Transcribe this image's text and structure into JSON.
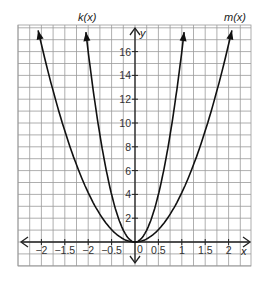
{
  "chart_data": {
    "type": "line",
    "title": "",
    "xlabel": "x",
    "ylabel": "y",
    "xlim": [
      -2.5,
      2.5
    ],
    "ylim": [
      -1,
      18
    ],
    "grid": true,
    "x_grid_step": 0.25,
    "y_grid_step": 1,
    "x_tick_labels": [
      "−2",
      "−1.5",
      "−2",
      "−0.5",
      "0",
      "0.5",
      "1",
      "1.5",
      "2"
    ],
    "x_tick_values": [
      -2,
      -1.5,
      -1,
      -0.5,
      0,
      0.5,
      1,
      1.5,
      2
    ],
    "y_tick_labels": [
      "2",
      "4",
      "6",
      "8",
      "10",
      "12",
      "14",
      "16"
    ],
    "y_tick_values": [
      2,
      4,
      6,
      8,
      10,
      12,
      14,
      16
    ],
    "series": [
      {
        "name": "k(x)",
        "description": "narrow upward parabola through origin",
        "x": [
          -1.05,
          -1,
          -0.75,
          -0.5,
          -0.25,
          0,
          0.25,
          0.5,
          0.75,
          1,
          1.05
        ],
        "y": [
          17.6,
          16,
          9,
          4,
          1,
          0,
          1,
          4,
          9,
          16,
          17.6
        ]
      },
      {
        "name": "m(x)",
        "description": "wider upward parabola through origin",
        "x": [
          -2.07,
          -2,
          -1.5,
          -1,
          -0.5,
          0,
          0.5,
          1,
          1.5,
          2,
          2.07
        ],
        "y": [
          17.8,
          16.4,
          9.6,
          4.6,
          1.3,
          0,
          1.3,
          4.6,
          9.6,
          16.4,
          17.8
        ]
      }
    ],
    "legend": [],
    "annotations": [
      "k(x)",
      "m(x)"
    ]
  },
  "labels": {
    "x_axis": "x",
    "y_axis": "y",
    "k_label": "k(x)",
    "m_label": "m(x)",
    "origin": "0"
  }
}
